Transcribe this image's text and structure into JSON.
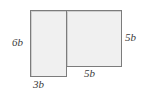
{
  "figure": {
    "type": "composite-rectangle-diagram",
    "background_color": "#ffffff",
    "fill_color": "#f0f0f0",
    "stroke_color": "#7c7c7c",
    "label_color": "#3b3b3b",
    "shapes": [
      {
        "id": "rect-left",
        "name": "left-rectangle",
        "width_label": "3b",
        "height_label": "6b"
      },
      {
        "id": "rect-right",
        "name": "right-rectangle",
        "width_label": "5b",
        "height_label": "5b"
      }
    ],
    "labels": {
      "left_height": "6b",
      "right_height": "5b",
      "bottom_left_width": "3b",
      "bottom_right_width": "5b"
    }
  }
}
